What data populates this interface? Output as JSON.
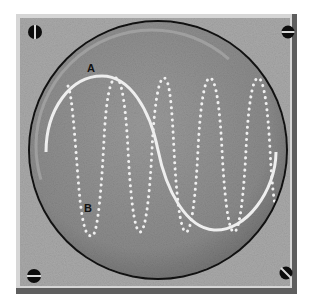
{
  "diagram": {
    "frame": {
      "color": "#a9a9a9",
      "border_light": "#d6d6d6",
      "border_dark": "#5e5e5e"
    },
    "screen": {
      "fill": "#8f8f8f",
      "rim_color": "#111111",
      "inner_ring_color": "#b8b8b8"
    },
    "screws": [
      {
        "position": "top-left",
        "slot": "vertical"
      },
      {
        "position": "top-right",
        "slot": "horizontal"
      },
      {
        "position": "bottom-left",
        "slot": "horizontal"
      },
      {
        "position": "bottom-right",
        "slot": "diagonal"
      }
    ],
    "waves": [
      {
        "label": "A",
        "style": "solid",
        "color": "#f2f2f2",
        "cycles": 1
      },
      {
        "label": "B",
        "style": "dotted",
        "color": "#f2f2f2",
        "cycles": 4
      }
    ]
  }
}
